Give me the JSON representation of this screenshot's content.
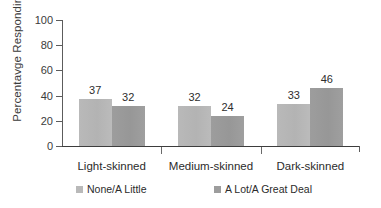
{
  "chart_data": {
    "type": "bar",
    "title": "",
    "subtitle": "",
    "xlabel": "",
    "ylabel": "Percentavge Responding",
    "categories": [
      "Light-skinned",
      "Medium-skinned",
      "Dark-skinned"
    ],
    "series": [
      {
        "name": "None/A Little",
        "color": "#b9b9b9",
        "values": [
          37,
          32,
          33
        ]
      },
      {
        "name": "A Lot/A Great Deal",
        "color": "#9d9d9d",
        "values": [
          32,
          24,
          46
        ]
      }
    ],
    "ylim": [
      0,
      100
    ],
    "yticks": [
      0,
      20,
      40,
      60,
      80,
      100
    ],
    "ytick_labels": [
      "0",
      "20",
      "40",
      "60",
      "80",
      "100"
    ],
    "grid": false,
    "legend_position": "bottom",
    "data_labels": [
      {
        "category": "Light-skinned",
        "series": "None/A Little",
        "value": 37,
        "text": "37"
      },
      {
        "category": "Light-skinned",
        "series": "A Lot/A Great Deal",
        "value": 32,
        "text": "32"
      },
      {
        "category": "Medium-skinned",
        "series": "None/A Little",
        "value": 42,
        "text": "42"
      },
      {
        "category": "Medium-skinned",
        "series": "A Lot/A Great Deal",
        "value": 24,
        "text": "24"
      },
      {
        "category": "Dark-skinned",
        "series": "None/A Little",
        "value": 33,
        "text": "33"
      },
      {
        "category": "Dark-skinned",
        "series": "A Lot/A Great Deal",
        "value": 46,
        "text": "46"
      }
    ]
  },
  "axis": {
    "y_title": "Percentavge Responding",
    "ticks": [
      "100",
      "80",
      "60",
      "40",
      "20",
      "0"
    ]
  },
  "categories": {
    "c0": "Light-skinned",
    "c1": "Medium-skinned",
    "c2": "Dark-skinned"
  },
  "values": {
    "g0s0": "37",
    "g0s1": "32",
    "g1s0": "42",
    "g1s1": "24",
    "g2s0": "33",
    "g2s1": "46"
  },
  "legend": {
    "item0": "None/A Little",
    "item1": "A Lot/A Great Deal"
  },
  "colors": {
    "series1": "#b9b9b9",
    "series2": "#9d9d9d",
    "axis": "#3d3d3d",
    "text": "#2b2b2b"
  }
}
